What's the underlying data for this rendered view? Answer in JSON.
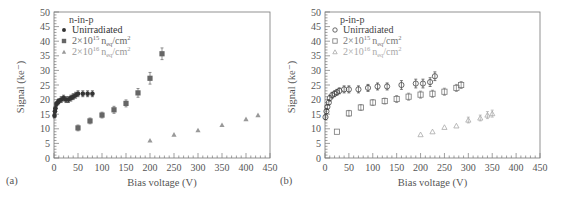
{
  "chart_data": [
    {
      "type": "scatter",
      "panel_label": "(a)",
      "title": "n-in-p",
      "xlabel": "Bias voltage (V)",
      "ylabel": "Signal (ke⁻)",
      "xlim": [
        0,
        450
      ],
      "ylim": [
        0,
        50
      ],
      "xticks": [
        0,
        50,
        100,
        150,
        200,
        250,
        300,
        350,
        400,
        450
      ],
      "yticks": [
        0,
        5,
        10,
        15,
        20,
        25,
        30,
        35,
        40,
        45,
        50
      ],
      "grid": false,
      "legend_position": "top-left",
      "series": [
        {
          "name": "Unirradiated",
          "legend_base": "Unirradiated",
          "legend_exp": "",
          "legend_tail": "",
          "marker": "filled-circle",
          "color": "#333333",
          "x": [
            1,
            2,
            3,
            5,
            8,
            10,
            15,
            20,
            25,
            30,
            35,
            40,
            45,
            50,
            60,
            70,
            80
          ],
          "y": [
            14.5,
            16,
            17,
            18.5,
            19,
            19.5,
            20,
            20.5,
            20,
            20,
            20.5,
            21,
            21.5,
            22,
            22,
            22,
            22
          ],
          "err": [
            0.8,
            0.8,
            0.8,
            0.8,
            0.8,
            0.8,
            1,
            1,
            1,
            1,
            1,
            1,
            1,
            1,
            1,
            1,
            1
          ]
        },
        {
          "name": "2×10^15 n_eq/cm^2",
          "legend_base": "2×10",
          "legend_exp": "15",
          "legend_tail": "n",
          "legend_sub": "eq",
          "legend_unit": "/cm",
          "legend_unit_exp": "2",
          "marker": "filled-square",
          "color": "#666666",
          "x": [
            50,
            75,
            100,
            125,
            150,
            175,
            200,
            225
          ],
          "y": [
            10.3,
            12.7,
            14.7,
            16.5,
            18.7,
            22.3,
            27.3,
            35.7
          ],
          "err": [
            1,
            1,
            1,
            1.2,
            1.2,
            1.5,
            2,
            2
          ]
        },
        {
          "name": "2×10^16 n_eq/cm^2",
          "legend_base": "2×10",
          "legend_exp": "16",
          "legend_tail": "n",
          "legend_sub": "eq",
          "legend_unit": "/cm",
          "legend_unit_exp": "2",
          "marker": "filled-triangle",
          "color": "#999999",
          "x": [
            200,
            250,
            300,
            350,
            400,
            425
          ],
          "y": [
            6,
            8,
            9.5,
            11.3,
            13.3,
            14.7
          ],
          "err": [
            0,
            0,
            0,
            0,
            0,
            0
          ]
        }
      ]
    },
    {
      "type": "scatter",
      "panel_label": "(b)",
      "title": "p-in-p",
      "xlabel": "Bias voltage (V)",
      "ylabel": "Signal (ke⁻)",
      "xlim": [
        0,
        450
      ],
      "ylim": [
        0,
        50
      ],
      "xticks": [
        0,
        50,
        100,
        150,
        200,
        250,
        300,
        350,
        400,
        450
      ],
      "yticks": [
        0,
        5,
        10,
        15,
        20,
        25,
        30,
        35,
        40,
        45,
        50
      ],
      "grid": false,
      "legend_position": "top-left",
      "series": [
        {
          "name": "Unirradiated",
          "legend_base": "Unirradiated",
          "legend_exp": "",
          "legend_tail": "",
          "marker": "open-circle",
          "color": "#444444",
          "x": [
            1,
            3,
            5,
            8,
            10,
            15,
            20,
            25,
            30,
            40,
            50,
            70,
            90,
            110,
            130,
            160,
            190,
            205,
            220,
            230
          ],
          "y": [
            14,
            16,
            17.5,
            19,
            20.5,
            21.5,
            22,
            22.5,
            23,
            23.5,
            23.5,
            23.5,
            24,
            24.5,
            24.5,
            25,
            25.5,
            25.5,
            26,
            28
          ],
          "err": [
            0.8,
            0.8,
            0.8,
            0.8,
            1,
            1,
            1,
            1,
            1,
            1.2,
            1.2,
            1.2,
            1.2,
            1.2,
            1.2,
            1.5,
            1.5,
            1.5,
            1.5,
            1.5
          ]
        },
        {
          "name": "2×10^15 n_eq/cm^2",
          "legend_base": "2×10",
          "legend_exp": "15",
          "legend_tail": "n",
          "legend_sub": "eq",
          "legend_unit": "/cm",
          "legend_unit_exp": "2",
          "marker": "open-square",
          "color": "#777777",
          "x": [
            25,
            50,
            75,
            100,
            125,
            150,
            175,
            200,
            225,
            250,
            275,
            285
          ],
          "y": [
            9,
            15.3,
            17.3,
            19,
            19.5,
            20.2,
            21,
            21.7,
            22,
            22.7,
            24,
            25
          ],
          "err": [
            0,
            1,
            1,
            1,
            1,
            1.2,
            1.2,
            1.2,
            1.2,
            1.2,
            1.2,
            1.2
          ]
        },
        {
          "name": "2×10^16 n_eq/cm^2",
          "legend_base": "2×10",
          "legend_exp": "16",
          "legend_tail": "n",
          "legend_sub": "eq",
          "legend_unit": "/cm",
          "legend_unit_exp": "2",
          "marker": "open-triangle",
          "color": "#aaaaaa",
          "x": [
            200,
            225,
            250,
            275,
            300,
            325,
            340,
            350
          ],
          "y": [
            8,
            9,
            10.5,
            11,
            13,
            13.7,
            14.7,
            15.2
          ],
          "err": [
            0,
            0,
            0,
            0,
            1,
            1,
            1.2,
            1.2
          ]
        }
      ]
    }
  ]
}
